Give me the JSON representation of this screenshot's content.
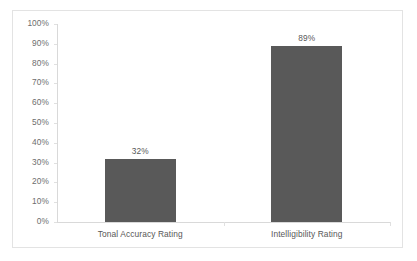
{
  "chart_data": {
    "type": "bar",
    "title": "",
    "xlabel": "",
    "ylabel": "",
    "categories": [
      "Tonal Accuracy Rating",
      "Intelligibility Rating"
    ],
    "values": [
      32,
      89
    ],
    "value_labels": [
      "32%",
      "89%"
    ],
    "ylim": [
      0,
      100
    ],
    "yticks": [
      0,
      10,
      20,
      30,
      40,
      50,
      60,
      70,
      80,
      90,
      100
    ],
    "ytick_labels": [
      "0%",
      "10%",
      "20%",
      "30%",
      "40%",
      "50%",
      "60%",
      "70%",
      "80%",
      "90%",
      "100%"
    ],
    "grid": false,
    "legend": false,
    "legend_position": "none",
    "series": [
      {
        "name": "Rating",
        "values": [
          32,
          89
        ],
        "color": "#595959"
      }
    ],
    "colors": {
      "bar": "#595959",
      "axis": "#d9d9d9",
      "frame": "#e3e3e3",
      "text": "#575757",
      "background": "#ffffff"
    }
  }
}
